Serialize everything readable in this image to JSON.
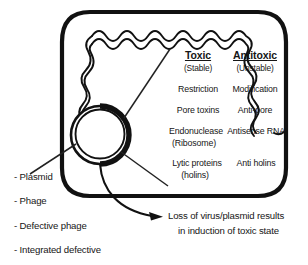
{
  "figure": {
    "kind": "toxin-antitoxin-cell-diagram",
    "columns": {
      "toxic": {
        "heading": "Toxic",
        "subheading": "(Stable)"
      },
      "antitoxic": {
        "heading": "Antitoxic",
        "subheading": "(Unstable)"
      }
    },
    "rows": [
      {
        "toxic": "Restriction",
        "toxic_sub": "",
        "antitoxic": "Modification",
        "antitoxic_sub": ""
      },
      {
        "toxic": "Pore toxins",
        "toxic_sub": "",
        "antitoxic": "Anti-pore",
        "antitoxic_sub": ""
      },
      {
        "toxic": "Endonuclease",
        "toxic_sub": "(Ribosome)",
        "antitoxic": "Antisense RNA",
        "antitoxic_sub": ""
      },
      {
        "toxic": "Lytic proteins",
        "toxic_sub": "(holins)",
        "antitoxic": "Anti holins",
        "antitoxic_sub": ""
      }
    ],
    "legend": [
      {
        "label": "- Plasmid"
      },
      {
        "label": "- Phage"
      },
      {
        "label": "- Defective phage"
      },
      {
        "label": "- Integrated defective"
      }
    ],
    "caption": {
      "line1": "Loss of virus/plasmid results",
      "line2": "in induction of toxic state"
    },
    "colors": {
      "stroke": "#111111",
      "text": "#161616",
      "background": "#ffffff"
    },
    "shapes": {
      "cell_membrane": "rounded-rectangle-cell-outline",
      "chromosome": "wavy-double-line-chromosome",
      "plasmid": "double-ring-circle",
      "pointer_toxic": "leader-line-to-toxic-column",
      "pointer_holins": "leader-line-to-holins",
      "pointer_plasmid": "leader-line-to-plasmid-label",
      "caption_arrow": "curved-arrow-to-caption"
    }
  }
}
